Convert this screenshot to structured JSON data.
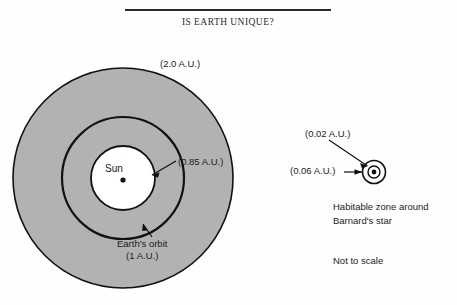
{
  "figure": {
    "title": "IS EARTH UNIQUE?",
    "caption_note": "Not to scale",
    "solar_system": {
      "outer_zone_label": "(2.0 A.U.)",
      "inner_zone_label": "(0.85 A.U.)",
      "star_label": "Sun",
      "orbit_label_line1": "Earth's orbit",
      "orbit_label_line2": "(1 A.U.)"
    },
    "barnards_star": {
      "inner_zone_label": "(0.02 A.U.)",
      "outer_zone_label": "(0.06 A.U.)",
      "caption_line1": "Habitable zone around",
      "caption_line2": "Barnard's star"
    },
    "colors": {
      "habitable_fill": "#b2b2b2",
      "stroke": "#111111",
      "background": "#fefefe",
      "text": "#1c1c1c"
    }
  }
}
